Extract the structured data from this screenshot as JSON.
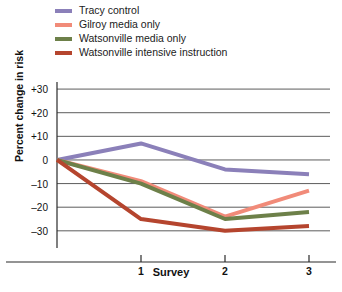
{
  "chart_data": {
    "type": "line",
    "title": "",
    "xlabel": "Survey",
    "ylabel": "Percent change in risk",
    "x": [
      0,
      1,
      2,
      3
    ],
    "categories": [
      "",
      "1",
      "2",
      "3"
    ],
    "xtick_labels": [
      "1",
      "2",
      "3"
    ],
    "xtick_values": [
      1,
      2,
      3
    ],
    "ytick_labels": [
      "+30",
      "+20",
      "+10",
      "0",
      "–10",
      "–20",
      "–30"
    ],
    "ytick_values": [
      30,
      20,
      10,
      0,
      -10,
      -20,
      -30
    ],
    "ylim": [
      -36,
      33
    ],
    "xlim": [
      0,
      3.25
    ],
    "grid": true,
    "legend_position": "top-left",
    "series": [
      {
        "name": "Tracy control",
        "color": "#8b80b9",
        "values": [
          0,
          7,
          -4,
          -6
        ]
      },
      {
        "name": "Gilroy media only",
        "color": "#f18b79",
        "values": [
          0,
          -9,
          -24,
          -13
        ]
      },
      {
        "name": "Watsonville media only",
        "color": "#6d8049",
        "values": [
          0,
          -10,
          -25,
          -22
        ]
      },
      {
        "name": "Watsonville intensive instruction",
        "color": "#b5452e",
        "values": [
          0,
          -25,
          -30,
          -28
        ]
      }
    ]
  }
}
